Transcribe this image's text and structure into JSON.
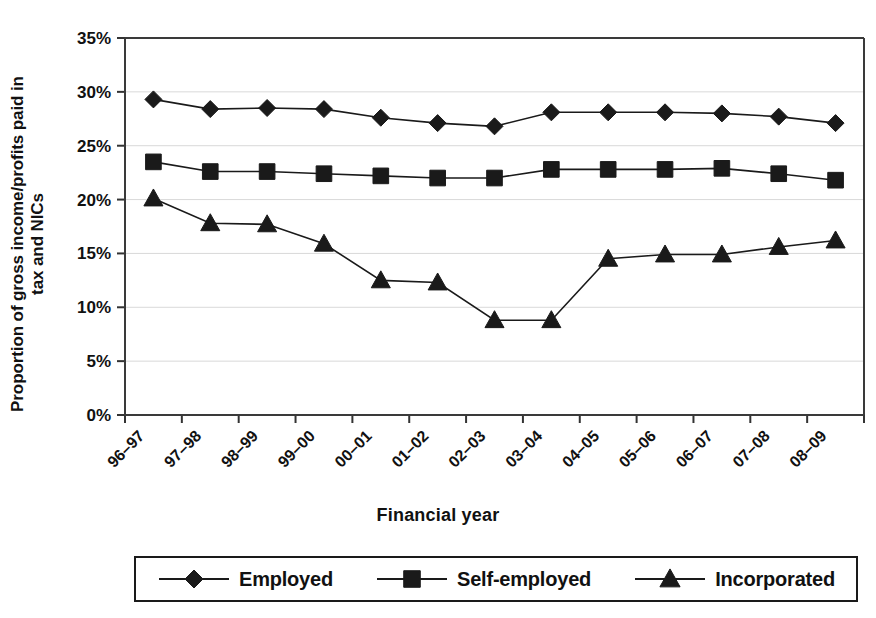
{
  "chart_data": {
    "type": "line",
    "title": "",
    "xlabel": "Financial year",
    "ylabel_line1": "Proportion of gross income/profits paid in",
    "ylabel_line2": "tax and NICs",
    "categories": [
      "96–97",
      "97–98",
      "98–99",
      "99–00",
      "00–01",
      "01–02",
      "02–03",
      "03–04",
      "04–05",
      "05–06",
      "06–07",
      "07–08",
      "08–09"
    ],
    "ylim": [
      0,
      35
    ],
    "ytick_values": [
      0,
      5,
      10,
      15,
      20,
      25,
      30,
      35
    ],
    "ytick_labels": [
      "0%",
      "5%",
      "10%",
      "15%",
      "20%",
      "25%",
      "30%",
      "35%"
    ],
    "grid": true,
    "grid_axis": "y",
    "legend_position": "bottom",
    "series": [
      {
        "name": "Employed",
        "marker": "diamond",
        "color": "#1a1a1a",
        "values": [
          29.3,
          28.4,
          28.5,
          28.4,
          27.6,
          27.1,
          26.8,
          28.1,
          28.1,
          28.1,
          28.0,
          27.7,
          27.1
        ]
      },
      {
        "name": "Self-employed",
        "marker": "square",
        "color": "#1a1a1a",
        "values": [
          23.5,
          22.6,
          22.6,
          22.4,
          22.2,
          22.0,
          22.0,
          22.8,
          22.8,
          22.8,
          22.9,
          22.4,
          21.8
        ]
      },
      {
        "name": "Incorporated",
        "marker": "triangle",
        "color": "#1a1a1a",
        "values": [
          20.1,
          17.8,
          17.7,
          15.9,
          12.5,
          12.3,
          8.8,
          8.8,
          14.5,
          14.9,
          14.9,
          15.6,
          16.2
        ]
      }
    ]
  },
  "legend": {
    "items": [
      {
        "label": "Employed",
        "marker": "diamond"
      },
      {
        "label": "Self-employed",
        "marker": "square"
      },
      {
        "label": "Incorporated",
        "marker": "triangle"
      }
    ]
  }
}
